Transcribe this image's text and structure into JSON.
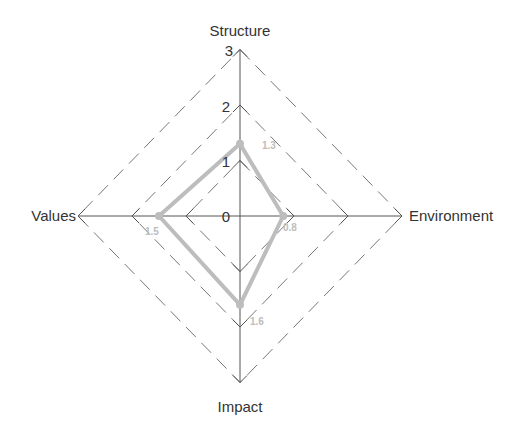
{
  "chart_data": {
    "type": "radar",
    "title": "",
    "axes": [
      "Structure",
      "Environment",
      "Impact",
      "Values"
    ],
    "values": [
      1.3,
      0.8,
      1.6,
      1.5
    ],
    "value_labels": [
      "1.3",
      "0.8",
      "1.6",
      "1.5"
    ],
    "rmin": 0,
    "rmax": 3,
    "ticks": [
      0,
      1,
      2,
      3
    ],
    "tick_labels": [
      "0",
      "1",
      "2",
      "3"
    ],
    "grid": "dashed diamonds at 1, 2, 3",
    "legend": "none",
    "series": [
      {
        "name": "",
        "values": [
          1.3,
          0.8,
          1.6,
          1.5
        ],
        "color": "#bdbdbd"
      }
    ]
  },
  "style": {
    "axis_color": "#555555",
    "grid_color": "#777777",
    "series_color": "#bdbdbd",
    "label_color": "#333333"
  }
}
